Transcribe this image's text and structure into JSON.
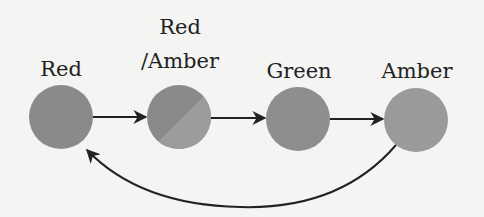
{
  "diagram": {
    "type": "state-cycle",
    "states": [
      {
        "id": "red",
        "label_lines": [
          "Red"
        ],
        "color": "#8a8a8a"
      },
      {
        "id": "red-amber",
        "label_lines": [
          "Red",
          "/Amber"
        ],
        "color": "#8a8a8a",
        "color2": "#9a9a9a"
      },
      {
        "id": "green",
        "label_lines": [
          "Green"
        ],
        "color": "#8e8e8e"
      },
      {
        "id": "amber",
        "label_lines": [
          "Amber"
        ],
        "color": "#9a9a9a"
      }
    ],
    "transitions": [
      {
        "from": "red",
        "to": "red-amber"
      },
      {
        "from": "red-amber",
        "to": "green"
      },
      {
        "from": "green",
        "to": "amber"
      },
      {
        "from": "amber",
        "to": "red",
        "curved": true
      }
    ]
  }
}
